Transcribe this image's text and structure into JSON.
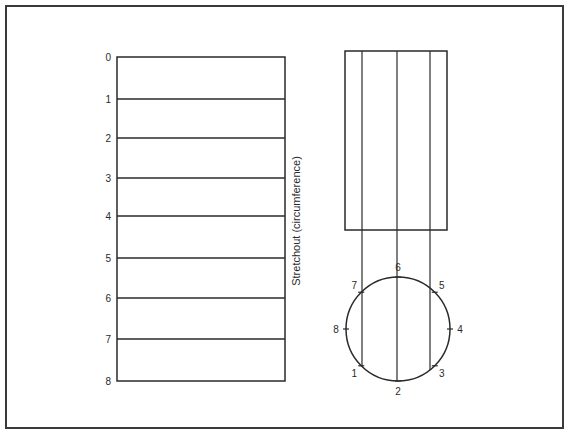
{
  "diagram": {
    "stretchout": {
      "axis_label": "Stretchout  (circumference)",
      "division_labels": [
        "0",
        "1",
        "2",
        "3",
        "4",
        "5",
        "6",
        "7",
        "8"
      ],
      "division_y": [
        57,
        99,
        138,
        178,
        216,
        258,
        298,
        339,
        381
      ]
    },
    "elevation": {
      "rect": {
        "x": 345,
        "y": 51,
        "w": 102,
        "h": 179
      },
      "element_lines_x": [
        362,
        397,
        430
      ]
    },
    "plan_circle": {
      "cx": 398,
      "cy": 329,
      "r": 52,
      "points": [
        {
          "label": "1",
          "angle_deg": 225
        },
        {
          "label": "2",
          "angle_deg": 270
        },
        {
          "label": "3",
          "angle_deg": 315
        },
        {
          "label": "4",
          "angle_deg": 0
        },
        {
          "label": "5",
          "angle_deg": 45
        },
        {
          "label": "6",
          "angle_deg": 90
        },
        {
          "label": "7",
          "angle_deg": 135
        },
        {
          "label": "8",
          "angle_deg": 180
        }
      ]
    },
    "colors": {
      "line": "#2a2a2a",
      "background": "#ffffff"
    }
  }
}
